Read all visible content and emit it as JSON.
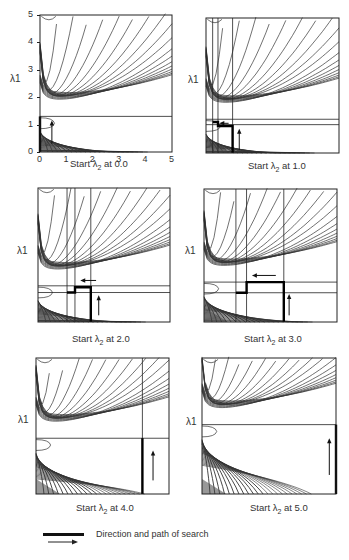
{
  "figure": {
    "axes": {
      "x_label": "λ2",
      "y_label": "λ1",
      "x_ticks": [
        "0",
        "1",
        "2",
        "3",
        "4",
        "5"
      ],
      "y_ticks": [
        "0",
        "1",
        "2",
        "3",
        "4",
        "5"
      ],
      "range": [
        0,
        5
      ]
    },
    "panels": [
      {
        "id": "p1",
        "caption_prefix": "Start ",
        "caption_sym": "λ",
        "caption_sub": "2",
        "caption_suffix": " at 0.0",
        "start_l2": 0.0,
        "ridge_l1": [
          1.3
        ],
        "thin_verticals": [],
        "path": [
          [
            0,
            0
          ],
          [
            0,
            1.3
          ]
        ],
        "arrow": {
          "x": 0.45,
          "y0": 0.3,
          "y1": 1.15,
          "dir": "up"
        },
        "show_ticks": true
      },
      {
        "id": "p2",
        "caption_prefix": "Start ",
        "caption_sym": "λ",
        "caption_sub": "2",
        "caption_suffix": " at 1.0",
        "start_l2": 1.0,
        "ridge_l1": [
          1.25,
          1.05
        ],
        "thin_verticals": [
          0.25,
          0.45,
          1.0
        ],
        "path": [
          [
            1.0,
            0
          ],
          [
            1.0,
            1.0
          ],
          [
            0.45,
            1.0
          ],
          [
            0.45,
            1.15
          ],
          [
            0.25,
            1.15
          ]
        ],
        "arrow": {
          "x": 1.25,
          "y0": 0.1,
          "y1": 0.9,
          "dir": "up"
        },
        "arrow2": {
          "y": 1.1,
          "x0": 0.85,
          "x1": 0.5,
          "dir": "left"
        },
        "show_ticks": false
      },
      {
        "id": "p3",
        "caption_prefix": "Start ",
        "caption_sym": "λ",
        "caption_sub": "2",
        "caption_suffix": " at 2.0",
        "start_l2": 2.0,
        "ridge_l1": [
          1.35,
          1.1
        ],
        "thin_verticals": [
          1.1,
          1.4,
          2.0
        ],
        "path": [
          [
            2.0,
            0
          ],
          [
            2.0,
            1.3
          ],
          [
            1.4,
            1.3
          ],
          [
            1.4,
            1.1
          ],
          [
            1.1,
            1.1
          ]
        ],
        "arrow": {
          "x": 2.3,
          "y0": 0.25,
          "y1": 1.0,
          "dir": "up"
        },
        "arrow2": {
          "y": 1.55,
          "x0": 2.2,
          "x1": 1.6,
          "dir": "left"
        },
        "show_ticks": false
      },
      {
        "id": "p4",
        "caption_prefix": "Start ",
        "caption_sym": "λ",
        "caption_sub": "2",
        "caption_suffix": " at 3.0",
        "start_l2": 3.0,
        "ridge_l1": [
          1.5,
          1.1
        ],
        "thin_verticals": [
          1.2,
          1.6,
          3.0
        ],
        "path": [
          [
            3.0,
            0
          ],
          [
            3.0,
            1.5
          ],
          [
            1.6,
            1.5
          ],
          [
            1.6,
            1.1
          ],
          [
            1.2,
            1.1
          ]
        ],
        "arrow": {
          "x": 3.2,
          "y0": 0.25,
          "y1": 1.05,
          "dir": "up"
        },
        "arrow2": {
          "y": 1.75,
          "x0": 2.7,
          "x1": 1.8,
          "dir": "left"
        },
        "show_ticks": false
      },
      {
        "id": "p5",
        "caption_prefix": "Start ",
        "caption_sym": "λ",
        "caption_sub": "2",
        "caption_suffix": " at 4.0",
        "start_l2": 4.0,
        "ridge_l1": [
          2.05
        ],
        "thin_verticals": [
          4.0
        ],
        "path": [
          [
            4.0,
            0
          ],
          [
            4.0,
            2.05
          ]
        ],
        "arrow": {
          "x": 4.4,
          "y0": 0.5,
          "y1": 1.6,
          "dir": "up"
        },
        "show_ticks": false
      },
      {
        "id": "p6",
        "caption_prefix": "Start ",
        "caption_sym": "λ",
        "caption_sub": "2",
        "caption_suffix": " at 5.0",
        "start_l2": 5.0,
        "ridge_l1": [
          2.55
        ],
        "thin_verticals": [],
        "path": [
          [
            5.0,
            0
          ],
          [
            5.0,
            2.55
          ]
        ],
        "arrow": {
          "x": 4.75,
          "y0": 0.7,
          "y1": 2.05,
          "dir": "up"
        },
        "show_ticks": false
      }
    ],
    "legend": {
      "label": "Direction and path of search",
      "items": [
        "heavy-line",
        "arrow"
      ]
    }
  }
}
